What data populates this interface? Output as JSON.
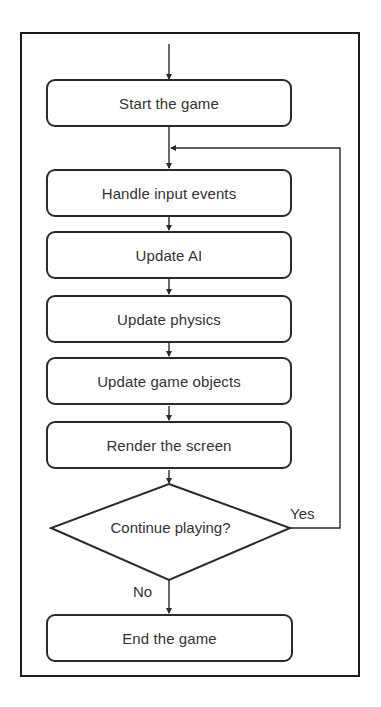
{
  "diagram": {
    "type": "flowchart",
    "nodes": [
      {
        "id": "start",
        "shape": "rounded-rect",
        "label": "Start the game"
      },
      {
        "id": "input",
        "shape": "rounded-rect",
        "label": "Handle input events"
      },
      {
        "id": "ai",
        "shape": "rounded-rect",
        "label": "Update AI"
      },
      {
        "id": "physics",
        "shape": "rounded-rect",
        "label": "Update physics"
      },
      {
        "id": "objects",
        "shape": "rounded-rect",
        "label": "Update game objects"
      },
      {
        "id": "render",
        "shape": "rounded-rect",
        "label": "Render the screen"
      },
      {
        "id": "decision",
        "shape": "diamond",
        "label": "Continue playing?"
      },
      {
        "id": "end",
        "shape": "rounded-rect",
        "label": "End the game"
      }
    ],
    "edges": [
      {
        "from": "entry",
        "to": "start",
        "label": ""
      },
      {
        "from": "start",
        "to": "input",
        "label": ""
      },
      {
        "from": "input",
        "to": "ai",
        "label": ""
      },
      {
        "from": "ai",
        "to": "physics",
        "label": ""
      },
      {
        "from": "physics",
        "to": "objects",
        "label": ""
      },
      {
        "from": "objects",
        "to": "render",
        "label": ""
      },
      {
        "from": "render",
        "to": "decision",
        "label": ""
      },
      {
        "from": "decision",
        "to": "input",
        "label": "Yes"
      },
      {
        "from": "decision",
        "to": "end",
        "label": "No"
      }
    ],
    "edge_labels": {
      "yes": "Yes",
      "no": "No"
    },
    "colors": {
      "stroke": "#2a2a2a",
      "text": "#333333",
      "background": "#ffffff"
    }
  }
}
